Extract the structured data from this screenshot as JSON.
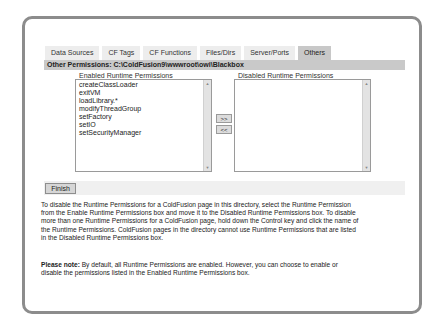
{
  "tabs": [
    {
      "label": "Data Sources",
      "active": false
    },
    {
      "label": "CF Tags",
      "active": false
    },
    {
      "label": "CF Functions",
      "active": false
    },
    {
      "label": "Files/Dirs",
      "active": false
    },
    {
      "label": "Server/Ports",
      "active": false
    },
    {
      "label": "Others",
      "active": true
    }
  ],
  "path_bar": "Other Permissions: C:\\ColdFusion9\\wwwroot\\owi\\Blackbox",
  "enabled_list": {
    "label": "Enabled Runtime Permissions",
    "items": [
      "createClassLoader",
      "exitVM",
      "loadLibrary.*",
      "modifyThreadGroup",
      "setFactory",
      "setIO",
      "setSecurityManager"
    ]
  },
  "disabled_list": {
    "label": "Disabled Runtime Permissions",
    "items": []
  },
  "buttons": {
    "move_right": ">>",
    "move_left": "<<",
    "finish": "Finish"
  },
  "scroll": {
    "up": "▲",
    "down": "▼"
  },
  "instructions": "To disable the Runtime Permissions for a ColdFusion page in this directory, select the Runtime Permission from the Enable Runtime Permissions box and move it to the Disabled Runtime Permissions box. To disable more than one Runtime Permissions for a ColdFusion page, hold down the Control key and click the name of the Runtime Permissions. ColdFusion pages in the directory cannot use Runtime Permissions that are listed in the Disabled Runtime Permissions box.",
  "note": {
    "label": "Please note:",
    "text": " By default, all Runtime Permissions are enabled. However, you can choose to enable or disable the permissions listed in the Enabled Runtime Permissions box."
  }
}
